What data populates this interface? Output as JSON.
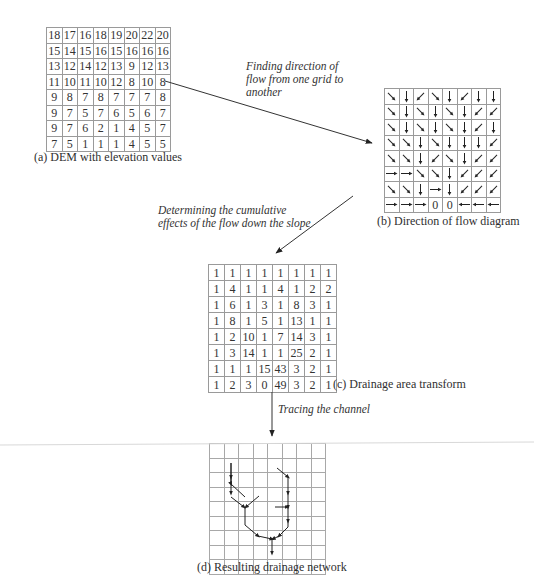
{
  "panels": {
    "a": {
      "caption": "(a) DEM with elevation values",
      "grid": [
        [
          "18",
          "17",
          "16",
          "18",
          "19",
          "20",
          "22",
          "20"
        ],
        [
          "15",
          "14",
          "15",
          "16",
          "15",
          "16",
          "16",
          "16"
        ],
        [
          "13",
          "12",
          "14",
          "12",
          "13",
          "9",
          "12",
          "13"
        ],
        [
          "11",
          "10",
          "11",
          "10",
          "12",
          "8",
          "10",
          "8"
        ],
        [
          "9",
          "8",
          "7",
          "8",
          "7",
          "7",
          "7",
          "8"
        ],
        [
          "9",
          "7",
          "5",
          "7",
          "6",
          "5",
          "6",
          "7"
        ],
        [
          "9",
          "7",
          "6",
          "2",
          "1",
          "4",
          "5",
          "7"
        ],
        [
          "7",
          "5",
          "1",
          "1",
          "1",
          "4",
          "5",
          "5"
        ]
      ]
    },
    "b": {
      "caption": "(b) Direction of flow diagram",
      "grid": [
        [
          "SE",
          "S",
          "SW",
          "SE",
          "S",
          "SW",
          "S",
          "S"
        ],
        [
          "SE",
          "S",
          "SE",
          "S",
          "SE",
          "S",
          "SW",
          "SW"
        ],
        [
          "SE",
          "S",
          "SE",
          "S",
          "SE",
          "S",
          "SW",
          "S"
        ],
        [
          "SE",
          "SE",
          "S",
          "SE",
          "S",
          "S",
          "S",
          "SW"
        ],
        [
          "SE",
          "SE",
          "S",
          "SW",
          "SE",
          "S",
          "SW",
          "SW"
        ],
        [
          "E",
          "E",
          "SE",
          "SE",
          "S",
          "SW",
          "SW",
          "SW"
        ],
        [
          "SE",
          "SE",
          "S",
          "E",
          "S",
          "SW",
          "SW",
          "SW"
        ],
        [
          "E",
          "E",
          "E",
          "0",
          "0",
          "W",
          "W",
          "W"
        ]
      ]
    },
    "c": {
      "caption": "(c) Drainage area transform",
      "grid": [
        [
          "1",
          "1",
          "1",
          "1",
          "1",
          "1",
          "1",
          "1"
        ],
        [
          "1",
          "4",
          "1",
          "1",
          "4",
          "1",
          "2",
          "2"
        ],
        [
          "1",
          "6",
          "1",
          "3",
          "1",
          "8",
          "3",
          "1"
        ],
        [
          "1",
          "8",
          "1",
          "5",
          "1",
          "13",
          "1",
          "1"
        ],
        [
          "1",
          "2",
          "10",
          "1",
          "7",
          "14",
          "3",
          "1"
        ],
        [
          "1",
          "3",
          "14",
          "1",
          "1",
          "25",
          "2",
          "1"
        ],
        [
          "1",
          "1",
          "1",
          "15",
          "43",
          "3",
          "2",
          "1"
        ],
        [
          "1",
          "2",
          "3",
          "0",
          "49",
          "3",
          "2",
          "1"
        ]
      ]
    },
    "d": {
      "caption": "(d) Resulting drainage network",
      "rows": 9,
      "cols": 8
    }
  },
  "notes": {
    "a_to_b": [
      "Finding direction of",
      "flow from one grid to",
      "another"
    ],
    "b_to_c": [
      "Determining the cumulative",
      "effects of the flow down the slope"
    ],
    "c_to_d": "Tracing the channel"
  },
  "colors": {
    "line": "#333333",
    "grid": "#9a9a9a"
  }
}
